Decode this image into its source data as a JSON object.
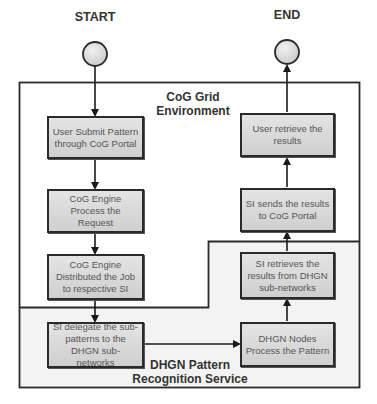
{
  "diagram": {
    "start_label": "START",
    "end_label": "END",
    "regions": {
      "cog_grid": {
        "label_line1": "CoG Grid",
        "label_line2": "Environment"
      },
      "dhgn": {
        "label_line1": "DHGN Pattern",
        "label_line2": "Recognition Service"
      }
    },
    "nodes": [
      {
        "id": "user-submit",
        "text": "User Submit Pattern through CoG Portal"
      },
      {
        "id": "cog-process",
        "text": "CoG Engine Process the Request"
      },
      {
        "id": "cog-distribute",
        "text": "CoG Engine Distributed the Job to respective SI"
      },
      {
        "id": "si-delegate",
        "text": "SI delegate the sub-patterns to the DHGN sub-networks"
      },
      {
        "id": "dhgn-process",
        "text": "DHGN Nodes Process the Pattern"
      },
      {
        "id": "si-retrieve",
        "text": "SI retrieves the results from DHGN sub-networks"
      },
      {
        "id": "si-send",
        "text": "SI sends the results to CoG Portal"
      },
      {
        "id": "user-retrieve",
        "text": "User retrieve the results"
      }
    ],
    "edges": [
      [
        "start",
        "user-submit"
      ],
      [
        "user-submit",
        "cog-process"
      ],
      [
        "cog-process",
        "cog-distribute"
      ],
      [
        "cog-distribute",
        "si-delegate"
      ],
      [
        "si-delegate",
        "dhgn-process"
      ],
      [
        "dhgn-process",
        "si-retrieve"
      ],
      [
        "si-retrieve",
        "si-send"
      ],
      [
        "si-send",
        "user-retrieve"
      ],
      [
        "user-retrieve",
        "end"
      ]
    ],
    "colors": {
      "stroke": "#2a2a2a",
      "box_fill": "#d8d8d8",
      "dhgn_fill": "#f3f3f3",
      "terminal_fill": "#dcdcdc",
      "text": "#555555",
      "label": "#333333"
    }
  }
}
